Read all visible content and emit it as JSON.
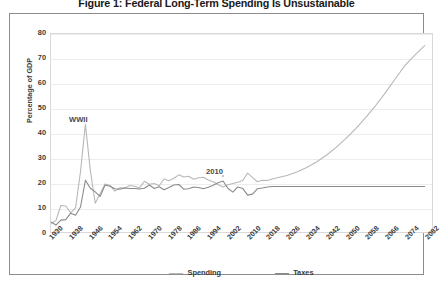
{
  "title": "Figure 1: Federal Long-Term Spending Is Unsustainable",
  "axes": {
    "ylabel": "Percentage of GDP",
    "yticks": [
      "0",
      "10",
      "20",
      "30",
      "40",
      "50",
      "60",
      "70",
      "80"
    ],
    "xticks": [
      "1930",
      "1938",
      "1946",
      "1954",
      "1962",
      "1970",
      "1978",
      "1986",
      "1994",
      "2002",
      "2010",
      "2018",
      "2026",
      "2034",
      "2042",
      "2050",
      "2058",
      "2066",
      "2074",
      "2082"
    ]
  },
  "legend": {
    "spending_label": "Spending",
    "taxes_label": "Taxes"
  },
  "annotations": {
    "wwii": "WWII",
    "year2010": "2010"
  },
  "colors": {
    "spending": "#b8b8b8",
    "taxes": "#8a8a8a",
    "grid": "#ededed",
    "frame": "#8c8c8c",
    "text": "#3a3a3a"
  },
  "chart_data": {
    "type": "line",
    "title": "Figure 1: Federal Long-Term Spending Is Unsustainable",
    "xlabel": "",
    "ylabel": "Percentage of GDP",
    "xlim": [
      1930,
      2085
    ],
    "ylim": [
      0,
      80
    ],
    "grid": true,
    "legend_position": "bottom",
    "annotations": [
      {
        "text": "WWII",
        "x": 1944,
        "y": 46
      },
      {
        "text": "2010",
        "x": 2010,
        "y": 27
      }
    ],
    "x": [
      1930,
      1932,
      1934,
      1936,
      1938,
      1940,
      1942,
      1944,
      1946,
      1948,
      1950,
      1952,
      1954,
      1956,
      1958,
      1960,
      1962,
      1964,
      1966,
      1968,
      1970,
      1972,
      1974,
      1976,
      1978,
      1980,
      1982,
      1984,
      1986,
      1988,
      1990,
      1992,
      1994,
      1996,
      1998,
      2000,
      2002,
      2004,
      2006,
      2008,
      2010,
      2012,
      2014,
      2016,
      2018,
      2020,
      2022,
      2026,
      2030,
      2034,
      2038,
      2042,
      2046,
      2050,
      2054,
      2058,
      2062,
      2066,
      2070,
      2074,
      2078,
      2082
    ],
    "series": [
      {
        "name": "Spending",
        "color": "#b8b8b8",
        "values": [
          3.4,
          4.6,
          10.7,
          10.5,
          7.7,
          9.8,
          24.3,
          43.6,
          24.8,
          11.6,
          15.6,
          19.4,
          18.8,
          16.5,
          17.9,
          17.8,
          18.8,
          18.5,
          17.8,
          20.5,
          19.3,
          19.6,
          18.7,
          21.4,
          20.7,
          21.7,
          23.1,
          22.2,
          22.5,
          21.3,
          21.9,
          22.1,
          21.0,
          20.3,
          19.1,
          18.2,
          19.1,
          19.6,
          20.1,
          20.8,
          23.8,
          22.0,
          20.3,
          20.9,
          20.8,
          21.4,
          21.9,
          22.8,
          24.2,
          26.1,
          28.3,
          31.0,
          34.2,
          37.8,
          41.8,
          46.2,
          51.0,
          56.2,
          61.8,
          67.3,
          71.5,
          75.3
        ]
      },
      {
        "name": "Taxes",
        "color": "#8a8a8a",
        "values": [
          4.1,
          2.8,
          4.8,
          5.0,
          7.6,
          6.8,
          10.1,
          20.9,
          17.7,
          16.2,
          14.4,
          19.0,
          18.5,
          17.5,
          17.3,
          17.8,
          17.6,
          17.6,
          17.4,
          17.7,
          19.0,
          17.6,
          18.3,
          17.1,
          18.0,
          19.0,
          19.2,
          17.3,
          17.5,
          18.2,
          18.0,
          17.5,
          18.1,
          18.9,
          19.9,
          20.6,
          17.6,
          16.1,
          18.2,
          17.6,
          14.9,
          15.3,
          17.5,
          17.8,
          18.2,
          18.4,
          18.4,
          18.4,
          18.4,
          18.4,
          18.4,
          18.4,
          18.4,
          18.4,
          18.4,
          18.4,
          18.4,
          18.4,
          18.4,
          18.4,
          18.4,
          18.4
        ]
      }
    ]
  }
}
